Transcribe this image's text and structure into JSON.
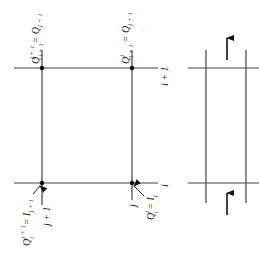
{
  "diagram": {
    "type": "finite-difference grid (rotated 90°)",
    "left_grid": {
      "row_labels": {
        "top": "i + 1",
        "bottom": "i"
      },
      "nodes": [
        {
          "id": "top-left",
          "label": "Q_i+1^j+1 = Q_j+1"
        },
        {
          "id": "top-right",
          "label": "Q_i+1^j = Q_j+1"
        },
        {
          "id": "bottom-left",
          "label": "Q_i^j+1 = I_j+1",
          "column_label": "j + 1"
        },
        {
          "id": "bottom-right",
          "label": "Q_i^j = I_j",
          "column_label": "j"
        }
      ],
      "text": {
        "tl_main": "Q",
        "tl_sup": "j + 1",
        "tl_sub": "i + 1",
        "tl_rhs": "= Q",
        "tl_rhs_sub": "j + 1",
        "tr_main": "Q",
        "tr_sup": "j",
        "tr_sub": "i + 1",
        "tr_rhs": "= Q",
        "tr_rhs_sub": "j + 1",
        "bl_main": "Q",
        "bl_sup": "j + 1",
        "bl_sub": "i",
        "bl_rhs": "= I",
        "bl_rhs_sub": "j + 1",
        "br_main": "Q",
        "br_sup": "j",
        "br_sub": "i",
        "br_rhs": "= I",
        "br_rhs_sub": "j",
        "col_j1": "j + 1",
        "col_j": "j",
        "row_i1": "i + 1",
        "row_i": "i"
      }
    },
    "right_grid": {
      "arrows": [
        {
          "position": "top",
          "direction": "up"
        },
        {
          "position": "bottom",
          "direction": "up"
        }
      ]
    },
    "colors": {
      "line": "#333333",
      "text": "#222222",
      "background": "#ffffff"
    }
  }
}
